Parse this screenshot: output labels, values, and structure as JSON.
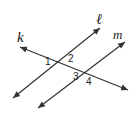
{
  "diagram": {
    "lines": [
      {
        "id": "k",
        "label": "k",
        "from": [
          20,
          47
        ],
        "to": [
          128,
          90
        ]
      },
      {
        "id": "l",
        "label": "ℓ",
        "from": [
          13,
          98
        ],
        "to": [
          100,
          28
        ]
      },
      {
        "id": "m",
        "label": "m",
        "from": [
          38,
          108
        ],
        "to": [
          125,
          42
        ]
      }
    ],
    "angles": [
      {
        "label": "1",
        "x": 46,
        "y": 65
      },
      {
        "label": "2",
        "x": 68,
        "y": 62
      },
      {
        "label": "3",
        "x": 74,
        "y": 84
      },
      {
        "label": "4",
        "x": 86,
        "y": 87
      }
    ],
    "colors": {
      "stroke": "#333333",
      "text": "#222222",
      "background": "#ffffff"
    }
  }
}
